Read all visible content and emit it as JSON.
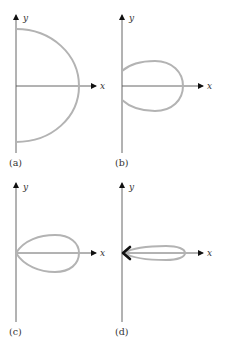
{
  "figure": {
    "curve_color": "#b3b3b3",
    "axis_color": "#555555",
    "arrow_color": "#111111",
    "panels": [
      {
        "id": "a",
        "label": "(a)",
        "x_axis_label": "x",
        "y_axis_label": "y",
        "shape": "semicircle"
      },
      {
        "id": "b",
        "label": "(b)",
        "x_axis_label": "x",
        "y_axis_label": "y",
        "shape": "offset-loop"
      },
      {
        "id": "c",
        "label": "(c)",
        "x_axis_label": "x",
        "y_axis_label": "y",
        "shape": "teardrop-loop"
      },
      {
        "id": "d",
        "label": "(d)",
        "x_axis_label": "x",
        "y_axis_label": "y",
        "shape": "narrow-loop-with-arrow"
      }
    ]
  }
}
